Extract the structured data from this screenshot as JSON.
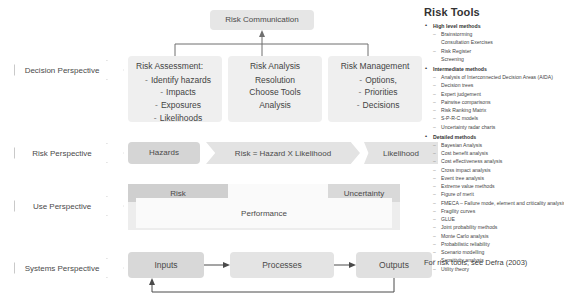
{
  "diagram": {
    "top_box": {
      "label": "Risk Communication"
    },
    "tier1": [
      {
        "id": "risk-assessment",
        "header": "Risk Assessment:",
        "items": [
          "Identify hazards",
          "Impacts",
          "Exposures",
          "Likelihoods"
        ]
      },
      {
        "id": "risk-analysis",
        "header": "Risk Analysis",
        "items": [
          "Resolution",
          "Choose Tools",
          "Analysis"
        ]
      },
      {
        "id": "risk-management",
        "header": "Risk Management",
        "items": [
          "Options,",
          "Priorities",
          "Decisions"
        ]
      }
    ],
    "perspectives": [
      {
        "id": "decision",
        "label": "Decision Perspective"
      },
      {
        "id": "risk",
        "label": "Risk Perspective"
      },
      {
        "id": "use",
        "label": "Use Perspective"
      },
      {
        "id": "systems",
        "label": "Systems Perspective"
      }
    ],
    "risk_row": {
      "hazards": "Hazards",
      "equation": "Risk = Hazard X Likelihood",
      "likelihood": "Likelihood"
    },
    "use_row": {
      "risk": "Risk",
      "uncertainty": "Uncertainty",
      "performance": "Performance"
    },
    "systems_row": {
      "inputs": "Inputs",
      "processes": "Processes",
      "outputs": "Outputs"
    }
  },
  "tools_panel": {
    "title": "Risk Tools",
    "groups": [
      {
        "heading": "High level methods",
        "items": [
          {
            "text": "Brainstorming",
            "dash": true
          },
          {
            "text": "Consultation Exercises",
            "dash": false
          },
          {
            "text": "Risk Register",
            "dash": true
          },
          {
            "text": "Screening",
            "dash": false
          }
        ]
      },
      {
        "heading": "Intermediate methods",
        "items": [
          {
            "text": "Analysis of Interconnected Decision Areas (AIDA)",
            "dash": true
          },
          {
            "text": "Decision trees",
            "dash": true
          },
          {
            "text": "Expert judgement",
            "dash": true
          },
          {
            "text": "Pairwise comparisons",
            "dash": true
          },
          {
            "text": "Risk Ranking Matrix",
            "dash": true
          },
          {
            "text": "S-P-R-C models",
            "dash": true
          },
          {
            "text": "Uncertainty radar charts",
            "dash": true
          }
        ]
      },
      {
        "heading": "Detailed methods",
        "items": [
          {
            "text": "Bayesian Analysis",
            "dash": true
          },
          {
            "text": "Cost benefit analysis",
            "dash": true
          },
          {
            "text": "Cost effectiveness analysis",
            "dash": true
          },
          {
            "text": "Cross impact analysis",
            "dash": true
          },
          {
            "text": "Event tree analysis",
            "dash": true
          },
          {
            "text": "Extreme value methods",
            "dash": true
          },
          {
            "text": "Figure of merit",
            "dash": true
          },
          {
            "text": "FMECA – Failure mode, element and criticality analysis",
            "dash": true
          },
          {
            "text": "Fragility curves",
            "dash": true
          },
          {
            "text": "GLUE",
            "dash": true
          },
          {
            "text": "Joint probability methods",
            "dash": true
          },
          {
            "text": "Monte Carlo analysis",
            "dash": true
          },
          {
            "text": "Probabilistic reliability",
            "dash": true
          },
          {
            "text": "Scenario modelling",
            "dash": true
          },
          {
            "text": "Sensitivity analysis",
            "dash": true
          },
          {
            "text": "Utility theory",
            "dash": true
          }
        ]
      }
    ],
    "footnote": "For risk tools, see Defra (2003)"
  }
}
